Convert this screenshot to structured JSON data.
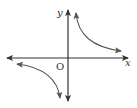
{
  "diagram": {
    "title": "",
    "type": "hyperbola-graph",
    "axes": {
      "x_label": "x",
      "y_label": "y",
      "origin_label": "O"
    },
    "curves": [
      {
        "name": "branch-quadrant-1",
        "description": "upper-right branch, arrows at both ends"
      },
      {
        "name": "branch-quadrant-3",
        "description": "lower-left branch, arrows at both ends"
      }
    ],
    "colors": {
      "axis": "#333333",
      "curve": "#555555",
      "background": "#ffffff"
    }
  }
}
